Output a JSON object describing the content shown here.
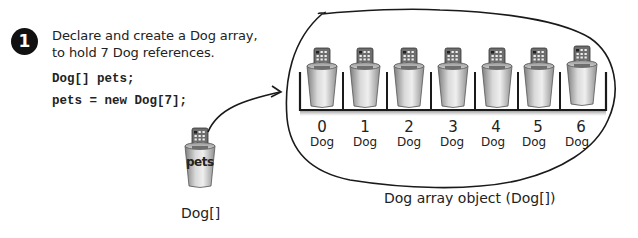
{
  "step": {
    "number": "1",
    "caption_line1": "Declare and create a Dog array,",
    "caption_line2": "to hold 7 Dog references.",
    "code_line1": "Dog[] pets;",
    "code_line2": "pets = new Dog[7];"
  },
  "reference_variable": {
    "cup_label": "pets",
    "type_label": "Dog[]",
    "icon": "remote-control-in-cup-icon"
  },
  "array_object": {
    "label": "Dog array object (Dog[])",
    "slots": [
      {
        "index": "0",
        "type": "Dog"
      },
      {
        "index": "1",
        "type": "Dog"
      },
      {
        "index": "2",
        "type": "Dog"
      },
      {
        "index": "3",
        "type": "Dog"
      },
      {
        "index": "4",
        "type": "Dog"
      },
      {
        "index": "5",
        "type": "Dog"
      },
      {
        "index": "6",
        "type": "Dog"
      }
    ]
  },
  "colors": {
    "ink": "#1a1a1a",
    "cup_light": "#e6e6e6",
    "cup_dark": "#8a8a8a",
    "remote": "#6b6b6b"
  }
}
